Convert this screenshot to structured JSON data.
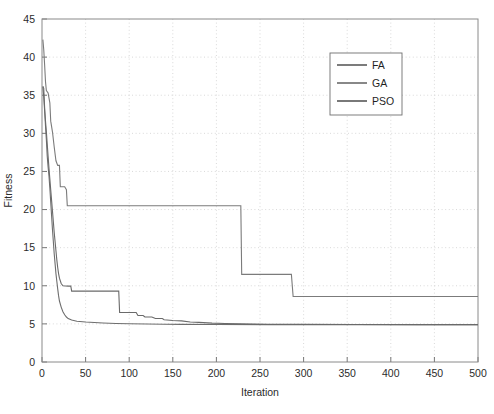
{
  "chart_data": {
    "type": "line",
    "title": "",
    "xlabel": "Iteration",
    "ylabel": "Fitness",
    "xlim": [
      0,
      500
    ],
    "ylim": [
      0,
      45
    ],
    "xticks": [
      0,
      50,
      100,
      150,
      200,
      250,
      300,
      350,
      400,
      450,
      500
    ],
    "yticks": [
      0,
      5,
      10,
      15,
      20,
      25,
      30,
      35,
      40,
      45
    ],
    "xtick_labels": [
      "0",
      "50",
      "100",
      "150",
      "200",
      "250",
      "300",
      "350",
      "400",
      "450",
      "500"
    ],
    "ytick_labels": [
      "0",
      "5",
      "10",
      "15",
      "20",
      "25",
      "30",
      "35",
      "40",
      "45"
    ],
    "grid": true,
    "grid_style": "dotted",
    "legend_position": "upper-right",
    "legend_entries": [
      "FA",
      "GA",
      "PSO"
    ],
    "series": [
      {
        "name": "FA",
        "color": "#6e6e6e",
        "width": 1.1,
        "points": [
          [
            1,
            36.2
          ],
          [
            2,
            35.9
          ],
          [
            3,
            33.4
          ],
          [
            4,
            31.0
          ],
          [
            5,
            29.2
          ],
          [
            6,
            27.0
          ],
          [
            7,
            25.6
          ],
          [
            8,
            24.4
          ],
          [
            9,
            22.8
          ],
          [
            10,
            21.0
          ],
          [
            11,
            19.2
          ],
          [
            12,
            17.4
          ],
          [
            13,
            15.8
          ],
          [
            14,
            14.2
          ],
          [
            15,
            12.9
          ],
          [
            16,
            11.6
          ],
          [
            17,
            10.6
          ],
          [
            18,
            9.6
          ],
          [
            19,
            8.7
          ],
          [
            20,
            8.0
          ],
          [
            22,
            7.2
          ],
          [
            24,
            6.6
          ],
          [
            26,
            6.2
          ],
          [
            28,
            5.9
          ],
          [
            30,
            5.7
          ],
          [
            34,
            5.5
          ],
          [
            40,
            5.35
          ],
          [
            50,
            5.25
          ],
          [
            60,
            5.18
          ],
          [
            70,
            5.12
          ],
          [
            85,
            5.06
          ],
          [
            100,
            5.02
          ],
          [
            120,
            4.98
          ],
          [
            140,
            4.95
          ],
          [
            160,
            4.93
          ],
          [
            200,
            4.91
          ],
          [
            260,
            4.9
          ],
          [
            340,
            4.89
          ],
          [
            420,
            4.89
          ],
          [
            500,
            4.89
          ]
        ]
      },
      {
        "name": "GA",
        "color": "#7b7b7b",
        "width": 1.1,
        "points": [
          [
            1,
            42.3
          ],
          [
            2,
            41.0
          ],
          [
            3,
            39.0
          ],
          [
            4,
            36.8
          ],
          [
            5,
            35.6
          ],
          [
            7,
            35.3
          ],
          [
            9,
            34.0
          ],
          [
            10,
            31.6
          ],
          [
            12,
            30.2
          ],
          [
            14,
            28.2
          ],
          [
            16,
            26.4
          ],
          [
            18,
            25.8
          ],
          [
            20,
            25.8
          ],
          [
            21,
            23.0
          ],
          [
            26,
            23.0
          ],
          [
            27,
            22.8
          ],
          [
            28,
            22.6
          ],
          [
            29,
            20.5
          ],
          [
            46,
            20.5
          ],
          [
            120,
            20.5
          ],
          [
            180,
            20.5
          ],
          [
            228,
            20.5
          ],
          [
            229,
            11.5
          ],
          [
            250,
            11.5
          ],
          [
            270,
            11.5
          ],
          [
            286,
            11.5
          ],
          [
            288,
            8.6
          ],
          [
            320,
            8.6
          ],
          [
            380,
            8.6
          ],
          [
            440,
            8.6
          ],
          [
            500,
            8.6
          ]
        ]
      },
      {
        "name": "PSO",
        "color": "#6a6a6a",
        "width": 1.1,
        "points": [
          [
            1,
            36.1
          ],
          [
            2,
            34.8
          ],
          [
            3,
            33.0
          ],
          [
            4,
            31.6
          ],
          [
            5,
            30.2
          ],
          [
            6,
            28.6
          ],
          [
            7,
            27.0
          ],
          [
            8,
            25.4
          ],
          [
            9,
            24.0
          ],
          [
            10,
            22.6
          ],
          [
            11,
            21.2
          ],
          [
            12,
            19.8
          ],
          [
            13,
            18.4
          ],
          [
            14,
            17.0
          ],
          [
            15,
            15.8
          ],
          [
            16,
            14.6
          ],
          [
            17,
            13.4
          ],
          [
            18,
            12.4
          ],
          [
            19,
            11.6
          ],
          [
            20,
            11.0
          ],
          [
            22,
            10.3
          ],
          [
            24,
            10.0
          ],
          [
            30,
            9.95
          ],
          [
            33,
            9.95
          ],
          [
            34,
            9.3
          ],
          [
            40,
            9.3
          ],
          [
            60,
            9.3
          ],
          [
            80,
            9.3
          ],
          [
            88,
            9.3
          ],
          [
            89,
            6.5
          ],
          [
            100,
            6.5
          ],
          [
            108,
            6.5
          ],
          [
            110,
            6.1
          ],
          [
            116,
            6.1
          ],
          [
            118,
            5.9
          ],
          [
            126,
            5.9
          ],
          [
            130,
            5.7
          ],
          [
            138,
            5.7
          ],
          [
            140,
            5.55
          ],
          [
            150,
            5.45
          ],
          [
            160,
            5.4
          ],
          [
            170,
            5.25
          ],
          [
            180,
            5.2
          ],
          [
            195,
            5.1
          ],
          [
            210,
            5.05
          ],
          [
            230,
            5.0
          ],
          [
            260,
            4.96
          ],
          [
            300,
            4.93
          ],
          [
            360,
            4.91
          ],
          [
            430,
            4.9
          ],
          [
            500,
            4.9
          ]
        ]
      }
    ]
  },
  "legend": {
    "items": [
      {
        "label": "FA",
        "color": "#6e6e6e"
      },
      {
        "label": "GA",
        "color": "#7b7b7b"
      },
      {
        "label": "PSO",
        "color": "#6a6a6a"
      }
    ]
  },
  "axes": {
    "x_title": "Iteration",
    "y_title": "Fitness"
  },
  "colors": {
    "frame": "#8a8a8a",
    "grid": "#c8c8c8",
    "text": "#2b2b2b",
    "background": "#ffffff"
  }
}
